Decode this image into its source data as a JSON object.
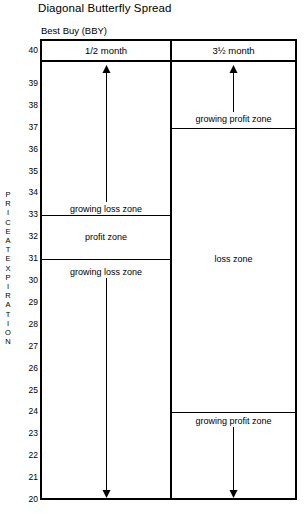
{
  "title": "Diagonal Butterfly Spread",
  "subtitle": "Best Buy (BBY)",
  "axis": {
    "label_chars": [
      "P",
      "R",
      "I",
      "C",
      "E",
      "A",
      "T",
      "E",
      "X",
      "P",
      "I",
      "R",
      "A",
      "T",
      "I",
      "O",
      "N"
    ],
    "label_text": "PRICE AT EXPIRATION",
    "ticks": [
      40,
      39,
      38,
      37,
      36,
      35,
      34,
      33,
      32,
      31,
      30,
      29,
      28,
      27,
      26,
      25,
      24,
      23,
      22,
      21,
      20
    ],
    "min": 20,
    "max": 40
  },
  "columns": [
    {
      "key": "left",
      "header": "1/2 month"
    },
    {
      "key": "right",
      "header": "3½ month"
    }
  ],
  "left_column": {
    "zones": [
      {
        "name": "growing loss zone",
        "top": 40,
        "bottom": 33,
        "label_at": 33.3,
        "arrow": "up"
      },
      {
        "name": "profit zone",
        "top": 33,
        "bottom": 31,
        "label_at": 32.0,
        "arrow": "none"
      },
      {
        "name": "growing loss zone",
        "top": 31,
        "bottom": 20,
        "label_at": 30.4,
        "arrow": "down"
      }
    ]
  },
  "right_column": {
    "zones": [
      {
        "name": "growing profit zone",
        "top": 40,
        "bottom": 37,
        "label_at": 37.4,
        "arrow": "up"
      },
      {
        "name": "loss zone",
        "top": 37,
        "bottom": 24,
        "label_at": 31.0,
        "arrow": "none"
      },
      {
        "name": "growing profit zone",
        "top": 24,
        "bottom": 20,
        "label_at": 23.6,
        "arrow": "down"
      }
    ]
  },
  "chart_data": {
    "type": "table",
    "title": "Diagonal Butterfly Spread",
    "subtitle": "Best Buy (BBY)",
    "ylabel": "PRICE AT EXPIRATION",
    "ylim": [
      20,
      40
    ],
    "ytick_labels": [
      40,
      39,
      38,
      37,
      36,
      35,
      34,
      33,
      32,
      31,
      30,
      29,
      28,
      27,
      26,
      25,
      24,
      23,
      22,
      21,
      20
    ],
    "grid": false,
    "legend": "none",
    "categories": [
      "1/2 month",
      "3½ month"
    ],
    "series": [
      {
        "name": "1/2 month",
        "zones": [
          {
            "label": "growing loss zone",
            "from": 33,
            "to": 40,
            "direction": "up"
          },
          {
            "label": "profit zone",
            "from": 31,
            "to": 33,
            "direction": "none"
          },
          {
            "label": "growing loss zone",
            "from": 20,
            "to": 31,
            "direction": "down"
          }
        ]
      },
      {
        "name": "3½ month",
        "zones": [
          {
            "label": "growing profit zone",
            "from": 37,
            "to": 40,
            "direction": "up"
          },
          {
            "label": "loss zone",
            "from": 24,
            "to": 37,
            "direction": "none"
          },
          {
            "label": "growing profit zone",
            "from": 20,
            "to": 24,
            "direction": "down"
          }
        ]
      }
    ]
  }
}
